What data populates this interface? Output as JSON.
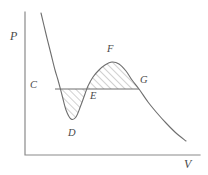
{
  "figure": {
    "width": 208,
    "height": 175,
    "background": "#ffffff",
    "line_color": "#6e6e6e",
    "axis_color": "#8a8a8a",
    "hatch_color": "#9a9a9a",
    "label_color": "#4a4a4a"
  },
  "axes": {
    "y_label": "P",
    "x_label": "V",
    "y_label_pos": {
      "x": 10,
      "y": 30
    },
    "x_label_pos": {
      "x": 184,
      "y": 158
    },
    "origin": {
      "x": 25,
      "y": 155
    },
    "y_top": 12,
    "x_right": 200,
    "ticks": [],
    "gridlines": false
  },
  "point_labels": [
    {
      "id": "C",
      "text": "C",
      "x": 30,
      "y": 80
    },
    {
      "id": "D",
      "text": "D",
      "x": 68,
      "y": 128
    },
    {
      "id": "E",
      "text": "E",
      "x": 90,
      "y": 91
    },
    {
      "id": "F",
      "text": "F",
      "x": 107,
      "y": 44
    },
    {
      "id": "G",
      "text": "G",
      "x": 140,
      "y": 75
    }
  ],
  "chart_data": {
    "type": "line",
    "title": "",
    "subtitle": "",
    "xlabel": "V",
    "ylabel": "P",
    "xlim": [
      25,
      200
    ],
    "ylim": [
      155,
      12
    ],
    "grid": false,
    "legend": null,
    "series": [
      {
        "name": "isotherm",
        "type": "curve",
        "stroke": "#6e6e6e",
        "stroke_width": 1.1,
        "points": [
          {
            "x": 41,
            "y": 13
          },
          {
            "x": 46,
            "y": 34
          },
          {
            "x": 51,
            "y": 54
          },
          {
            "x": 55,
            "y": 70
          },
          {
            "x": 58,
            "y": 80
          },
          {
            "x": 62,
            "y": 95
          },
          {
            "x": 66,
            "y": 110
          },
          {
            "x": 71,
            "y": 119
          },
          {
            "x": 76,
            "y": 117
          },
          {
            "x": 81,
            "y": 105
          },
          {
            "x": 85,
            "y": 94
          },
          {
            "x": 88,
            "y": 86
          },
          {
            "x": 93,
            "y": 77
          },
          {
            "x": 99,
            "y": 70
          },
          {
            "x": 105,
            "y": 65
          },
          {
            "x": 112,
            "y": 62
          },
          {
            "x": 119,
            "y": 64
          },
          {
            "x": 126,
            "y": 71
          },
          {
            "x": 132,
            "y": 80
          },
          {
            "x": 139,
            "y": 89
          },
          {
            "x": 148,
            "y": 102
          },
          {
            "x": 157,
            "y": 113
          },
          {
            "x": 166,
            "y": 123
          },
          {
            "x": 176,
            "y": 133
          },
          {
            "x": 186,
            "y": 141
          }
        ]
      },
      {
        "name": "tie-line",
        "type": "segment",
        "stroke": "#6e6e6e",
        "stroke_width": 1.0,
        "points": [
          {
            "x": 55,
            "y": 89
          },
          {
            "x": 139,
            "y": 89
          }
        ]
      }
    ],
    "annotated_points": [
      {
        "label": "C",
        "x": 55,
        "y": 89,
        "note": "left end of tie line, liquid branch"
      },
      {
        "label": "D",
        "x": 71,
        "y": 119,
        "note": "local minimum of isotherm"
      },
      {
        "label": "E",
        "x": 87,
        "y": 89,
        "note": "middle crossing of tie line"
      },
      {
        "label": "F",
        "x": 112,
        "y": 62,
        "note": "local maximum of isotherm"
      },
      {
        "label": "G",
        "x": 139,
        "y": 89,
        "note": "right end of tie line, vapour branch"
      }
    ],
    "shaded_regions": [
      {
        "name": "lower-lobe-CDE",
        "fill": "hatch-diagonal",
        "between": [
          "C",
          "D",
          "E"
        ],
        "note": "area enclosed below tie line between C, D and E"
      },
      {
        "name": "upper-lobe-EFG",
        "fill": "hatch-diagonal",
        "between": [
          "E",
          "F",
          "G"
        ],
        "note": "area enclosed above tie line between E, F and G"
      }
    ]
  }
}
